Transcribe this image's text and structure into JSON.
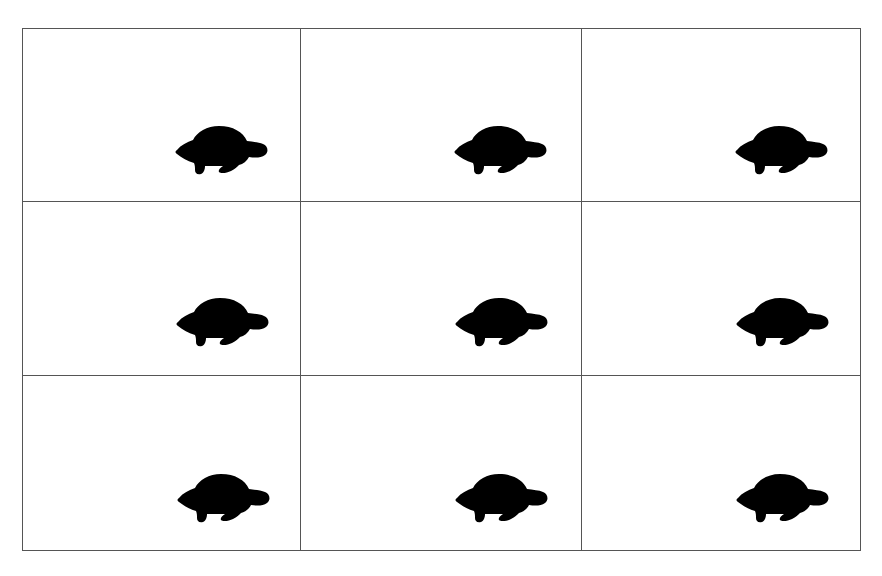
{
  "grid": {
    "rows": 3,
    "columns": 3,
    "line_color": "#555555",
    "background": "#ffffff"
  },
  "cells": [
    {
      "row": 0,
      "col": 0,
      "icon": "turtle-icon",
      "icon_color": "#000000"
    },
    {
      "row": 0,
      "col": 1,
      "icon": "turtle-icon",
      "icon_color": "#000000"
    },
    {
      "row": 0,
      "col": 2,
      "icon": "turtle-icon",
      "icon_color": "#000000"
    },
    {
      "row": 1,
      "col": 0,
      "icon": "turtle-icon",
      "icon_color": "#000000"
    },
    {
      "row": 1,
      "col": 1,
      "icon": "turtle-icon",
      "icon_color": "#000000"
    },
    {
      "row": 1,
      "col": 2,
      "icon": "turtle-icon",
      "icon_color": "#000000"
    },
    {
      "row": 2,
      "col": 0,
      "icon": "turtle-icon",
      "icon_color": "#000000"
    },
    {
      "row": 2,
      "col": 1,
      "icon": "turtle-icon",
      "icon_color": "#000000"
    },
    {
      "row": 2,
      "col": 2,
      "icon": "turtle-icon",
      "icon_color": "#000000"
    }
  ]
}
